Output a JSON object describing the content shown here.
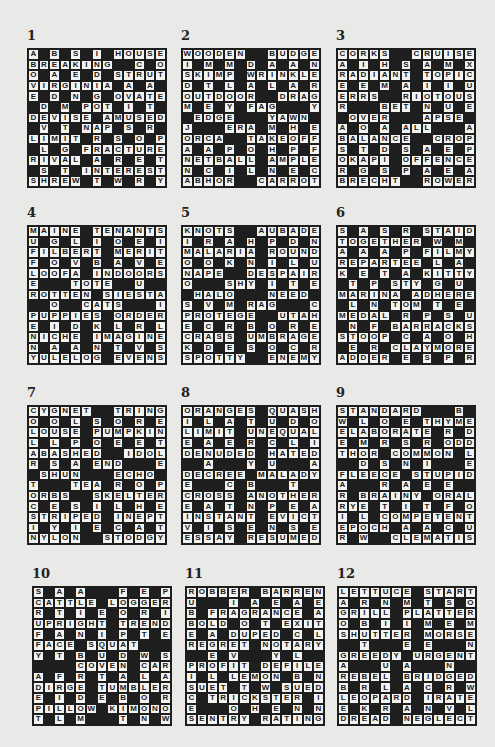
{
  "colors": {
    "black": "#1e1e1e",
    "white": "#f2f2f0",
    "page": "#e9e9e7"
  },
  "puzzles": [
    {
      "number": "1",
      "x": 27,
      "y": 48,
      "rows": [
        "A_B_S_I_HOUSE",
        "BREAKING__C_O",
        "O_A_E_D_STRUT",
        "VIRGINIA_A_A_",
        "E_D_N_G_OVATE",
        "_D_M_POT_I_T_",
        "DEVISE_AMUSED",
        "_V_T_NAP_S_R_",
        "LIMIT_R_S_O_P",
        "_L_G_FRACTURE",
        "RIVAL_A_R_E_T",
        "_S_T_INTEREST",
        "SHREW_T_W_R_Y"
      ]
    },
    {
      "number": "2",
      "x": 181,
      "y": 48,
      "rows": [
        "WOODEN__BUDGE",
        "I_M_M_D_A_A_N",
        "SKIMP_WRINKLE",
        "D_T_L_A_L_A_R",
        "OUTDOOR__DRAG",
        "M_E_Y_FAG___Y",
        "_EDGE___YAWN_",
        "J___ERA_M_H_E",
        "ORCA__TAKEOFF",
        "A_A_P_O_H_P_F",
        "NETBALL_AMPLE",
        "N_C_I_L_N_E_C",
        "ABHOR__CARROT"
      ]
    },
    {
      "number": "3",
      "x": 336,
      "y": 48,
      "rows": [
        "CORKS__CRUISE",
        "A_I_H_S_A_M_X",
        "RADIANT_TOPIC",
        "E_E_M_A_I_I_U",
        "ERRS__RIOTOUS",
        "R___BET_N_U_E",
        "_OVER___APSE_",
        "A_O_A_ALL___A",
        "BALANCE__CROP",
        "S_T_D_S_A_E_P",
        "OKAPI_OFFENCE",
        "R_G_S_P_A_E_A",
        "BRECHT__ROWER"
      ]
    },
    {
      "number": "4",
      "x": 27,
      "y": 225,
      "rows": [
        "MAINE_TENANTS",
        "U_G_L_I_O_E_I",
        "FILBERT_MERIT",
        "F_O_V_B_A_V_E",
        "LOOFA_INDOORS",
        "E___TOTE__U__",
        "ROTTEN_SIESTA",
        "__O__CATS___I",
        "PUPPIES_ORDER",
        "E_I_D_K_L_R_L",
        "NICHE_IMAGINE",
        "N_A_A_N_T_V_S",
        "YULELOG_EVENS"
      ]
    },
    {
      "number": "5",
      "x": 181,
      "y": 225,
      "rows": [
        "KNOTS__AUBADE",
        "I_R_A_H_P_D_N",
        "MALARIA_ROUND",
        "O_O_K_N_I_L_U",
        "NAPE__DESPAIR",
        "O___SHY_I_T_E",
        "_HALO___NEED_",
        "S_V_M_RAG___C",
        "PROTEGE__UTAH",
        "E_C_R_B_O_R_E",
        "CRASS_UMBRAGE",
        "K_D_E_S_O_C_R",
        "SPOTTY__ENEMY"
      ]
    },
    {
      "number": "6",
      "x": 336,
      "y": 225,
      "rows": [
        "S_A_S_R_STAID",
        "TOGETHER_W_M_",
        "A_A_A_P_FILMY",
        "REPARTEE_L_A_",
        "K_E_T_A_KITTY",
        "_T_P_STY_G_U_",
        "MARINA_ADHERE",
        "_L_N_TOM_T_E_",
        "MEDAL_R_P_S_U",
        "_N_F_BARRACKS",
        "STOOP_C_A_O_H",
        "_E_R_CLAYMORE",
        "ADDER_E_S_P_R"
      ]
    },
    {
      "number": "7",
      "x": 27,
      "y": 405,
      "rows": [
        "CYGNET__TRING",
        "O_O_L_S_O_R_E",
        "LOUSE_PUMPKIN",
        "L_L_P_O_E_E_T",
        "ABASHED__IDOL",
        "R_S_A_END___E",
        "_SHUN___ECHO_",
        "T___TEA_R_O_P",
        "ORBS__SKELTER",
        "C_E_S_I_L_H_E",
        "STRIPED_INEPT",
        "I_Y_I_E_C_A_T",
        "NYLON__STODGY"
      ]
    },
    {
      "number": "8",
      "x": 181,
      "y": 405,
      "rows": [
        "ORANGES_QUASH",
        "I_L_A_T_U_D_O",
        "LIMIT_UNEQUAL",
        "E_A_E_R_C_L_I",
        "DENUDED_HATED",
        "__A___Y_U___A",
        "DECREE_MALADY",
        "E___C_B___T__",
        "CROSS_ANOTHER",
        "E_A_T_N_P_E_A",
        "INSTANT_EVICT",
        "V_I_S_E_N_S_E",
        "ESSAY_RESUMED"
      ]
    },
    {
      "number": "9",
      "x": 336,
      "y": 405,
      "rows": [
        "STANDARD___B_P",
        "W_L_O_E_THYME",
        "ELABORATE_R_D",
        "E_M_R_S_R_ODD",
        "THOR_COMMON_L",
        "__D_S_N_I___E",
        "FLEECE_STUPID",
        "A___R_A_E_E__",
        "R_BRAINY_ORAL",
        "RYE_T_I_T_F_O",
        "I_L_COMPETENT",
        "EPOCH_A_A_C_U",
        "R_W__CLEMATIS"
      ]
    },
    {
      "number": "10",
      "x": 32,
      "y": 586,
      "rows": [
        "S_A_A___F_E_P",
        "CATTLE_LOGGER",
        "R_T_I_E_O_R_I",
        "UPRIGHT_TREND",
        "F_A_N_I_P_T_E",
        "FACE_SQUAT___",
        "Y_T_B_U_D_W_S",
        "____COVEN_CARP",
        "A_F_R_T_A_L_A",
        "DIRGE_TUMBLER",
        "E_I_D_E_B_O_R",
        "PILLOW_KIMONO",
        "T_L_M___T_N_W"
      ]
    },
    {
      "number": "11",
      "x": 185,
      "y": 586,
      "rows": [
        "ROBBER_BARREN",
        "U___I_A_E_A_E",
        "B_FRAGRANCE_A",
        "BOLD_O_T_EXIT",
        "E_A_DUPED_C_L",
        "REGRET_NOTARY",
        "__E_V___Y_L__",
        "PROFIT_DEFILE",
        "I_L_LEMON_B_N",
        "SUET_T_W_SUED",
        "C_TRICKSTER_I",
        "E___O_H_E_N_N",
        "SENTRY_RATING"
      ]
    },
    {
      "number": "12",
      "x": 337,
      "y": 586,
      "rows": [
        "LETTUCE_START",
        "A_R_N_M_T_S_O",
        "GRILL_PLATTER",
        "O_B_I_I_M_E_M",
        "SHUTTER_MORSE",
        "__T___E_E___N",
        "GREEDY_URGENT",
        "A___U_A___N__",
        "REBEL_BRIDGED",
        "B_R_L_A_C_R_W",
        "LEOPARD_IRATE",
        "E_K_R_A_N_V_L",
        "DREAD_NEGLECT"
      ]
    }
  ]
}
